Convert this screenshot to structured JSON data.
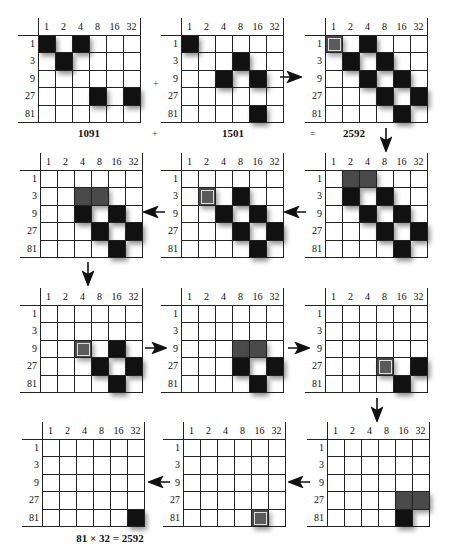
{
  "colors": {
    "filled": "#111111",
    "partial": "#4a4a4a",
    "grid_line": "#222222",
    "background": "#ffffff"
  },
  "column_headers": [
    "1",
    "2",
    "4",
    "8",
    "16",
    "32"
  ],
  "row_headers": [
    "1",
    "3",
    "9",
    "27",
    "81"
  ],
  "captions": {
    "first": "1091",
    "plus1": "+",
    "second": "1501",
    "equals": "=",
    "result": "2592",
    "final": "81 × 32 = 2592",
    "plus_marker": "+"
  },
  "grids": [
    {
      "id": "g1",
      "x": 38,
      "y": 35,
      "cells": [
        [
          0,
          0,
          "black"
        ],
        [
          0,
          2,
          "black"
        ],
        [
          1,
          1,
          "black"
        ],
        [
          3,
          3,
          "black"
        ],
        [
          3,
          5,
          "black"
        ]
      ]
    },
    {
      "id": "g2",
      "x": 181,
      "y": 35,
      "cells": [
        [
          0,
          0,
          "black"
        ],
        [
          1,
          3,
          "black"
        ],
        [
          2,
          2,
          "black"
        ],
        [
          2,
          4,
          "black"
        ],
        [
          4,
          4,
          "black"
        ]
      ]
    },
    {
      "id": "g3",
      "x": 325,
      "y": 35,
      "cells": [
        [
          0,
          0,
          "hl"
        ],
        [
          0,
          2,
          "black"
        ],
        [
          1,
          1,
          "black"
        ],
        [
          1,
          3,
          "black"
        ],
        [
          2,
          2,
          "black"
        ],
        [
          2,
          4,
          "black"
        ],
        [
          3,
          3,
          "black"
        ],
        [
          3,
          5,
          "black"
        ],
        [
          4,
          4,
          "black"
        ]
      ]
    },
    {
      "id": "g4",
      "x": 325,
      "y": 170,
      "cells": [
        [
          0,
          1,
          "gray"
        ],
        [
          0,
          2,
          "gray"
        ],
        [
          1,
          1,
          "black"
        ],
        [
          1,
          3,
          "black"
        ],
        [
          2,
          2,
          "black"
        ],
        [
          2,
          4,
          "black"
        ],
        [
          3,
          3,
          "black"
        ],
        [
          3,
          5,
          "black"
        ],
        [
          4,
          4,
          "black"
        ]
      ]
    },
    {
      "id": "g5",
      "x": 181,
      "y": 170,
      "cells": [
        [
          1,
          1,
          "hl"
        ],
        [
          1,
          3,
          "black"
        ],
        [
          2,
          2,
          "black"
        ],
        [
          2,
          4,
          "black"
        ],
        [
          3,
          3,
          "black"
        ],
        [
          3,
          5,
          "black"
        ],
        [
          4,
          4,
          "black"
        ]
      ]
    },
    {
      "id": "g6",
      "x": 40,
      "y": 170,
      "cells": [
        [
          1,
          2,
          "gray"
        ],
        [
          1,
          3,
          "gray"
        ],
        [
          2,
          2,
          "black"
        ],
        [
          2,
          4,
          "black"
        ],
        [
          3,
          3,
          "black"
        ],
        [
          3,
          5,
          "black"
        ],
        [
          4,
          4,
          "black"
        ]
      ]
    },
    {
      "id": "g7",
      "x": 40,
      "y": 305,
      "cells": [
        [
          2,
          2,
          "hl"
        ],
        [
          2,
          4,
          "black"
        ],
        [
          3,
          3,
          "black"
        ],
        [
          3,
          5,
          "black"
        ],
        [
          4,
          4,
          "black"
        ]
      ]
    },
    {
      "id": "g8",
      "x": 181,
      "y": 305,
      "cells": [
        [
          2,
          3,
          "gray"
        ],
        [
          2,
          4,
          "gray"
        ],
        [
          3,
          3,
          "black"
        ],
        [
          3,
          5,
          "black"
        ],
        [
          4,
          4,
          "black"
        ]
      ]
    },
    {
      "id": "g9",
      "x": 325,
      "y": 305,
      "cells": [
        [
          3,
          3,
          "hl"
        ],
        [
          3,
          5,
          "black"
        ],
        [
          4,
          4,
          "black"
        ]
      ]
    },
    {
      "id": "g10",
      "x": 327,
      "y": 439,
      "cells": [
        [
          3,
          4,
          "gray"
        ],
        [
          3,
          5,
          "gray"
        ],
        [
          4,
          4,
          "black"
        ]
      ]
    },
    {
      "id": "g11",
      "x": 183,
      "y": 439,
      "cells": [
        [
          4,
          4,
          "hl"
        ]
      ]
    },
    {
      "id": "g12",
      "x": 42,
      "y": 439,
      "cells": [
        [
          4,
          5,
          "black"
        ]
      ]
    }
  ],
  "arrows": [
    {
      "dir": "right",
      "x": 280,
      "y": 77,
      "label": "g2-to-g3"
    },
    {
      "dir": "down",
      "x": 386,
      "y": 128,
      "label": "g3-to-g4"
    },
    {
      "dir": "left",
      "x": 284,
      "y": 212,
      "label": "g4-to-g5"
    },
    {
      "dir": "left",
      "x": 143,
      "y": 212,
      "label": "g5-to-g6"
    },
    {
      "dir": "down",
      "x": 88,
      "y": 262,
      "label": "g6-to-g7"
    },
    {
      "dir": "right",
      "x": 145,
      "y": 348,
      "label": "g7-to-g8"
    },
    {
      "dir": "right",
      "x": 288,
      "y": 348,
      "label": "g8-to-g9"
    },
    {
      "dir": "down",
      "x": 377,
      "y": 398,
      "label": "g9-to-g10"
    },
    {
      "dir": "left",
      "x": 288,
      "y": 482,
      "label": "g10-to-g11"
    },
    {
      "dir": "left",
      "x": 148,
      "y": 482,
      "label": "g11-to-g12"
    }
  ]
}
